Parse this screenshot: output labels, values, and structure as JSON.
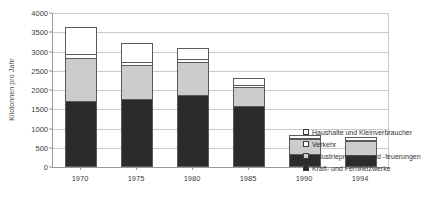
{
  "chart_data": {
    "type": "bar",
    "stacked": true,
    "title": "",
    "subtitle": "",
    "xlabel": "",
    "ylabel": "Kilotonnen pro Jahr",
    "categories": [
      "1970",
      "1975",
      "1980",
      "1985",
      "1990",
      "1994"
    ],
    "ylim": [
      0,
      4000
    ],
    "ytick_step": 500,
    "yticks": [
      "0",
      "500",
      "1000",
      "1500",
      "2000",
      "2500",
      "3000",
      "3500",
      "4000"
    ],
    "ytick_values": [
      0,
      500,
      1000,
      1500,
      2000,
      2500,
      3000,
      3500,
      4000
    ],
    "grid": true,
    "grid_axis": "y",
    "legend_position": "right-lower",
    "stack_order_bottom_to_top": [
      "Kraft- und Fernheizwerke",
      "Industrieprozesse und -feuerungen",
      "Verkehr",
      "Haushalte und Kleinverbraucher"
    ],
    "series": [
      {
        "name": "Haushalte und Kleinverbraucher",
        "color": "#ffffff",
        "values": [
          720,
          510,
          300,
          210,
          100,
          110
        ]
      },
      {
        "name": "Verkehr",
        "color": "#ffffff",
        "values": [
          130,
          120,
          110,
          70,
          50,
          50
        ]
      },
      {
        "name": "Industrieprozesse und -feuerungen",
        "color": "#cccccc",
        "values": [
          1150,
          900,
          870,
          520,
          420,
          390
        ]
      },
      {
        "name": "Kraft- und Fernheizwerke",
        "color": "#2b2b2b",
        "values": [
          1710,
          1770,
          1880,
          1580,
          330,
          310
        ]
      }
    ],
    "totals": [
      3710,
      3300,
      3160,
      2380,
      900,
      860
    ]
  },
  "legend": {
    "items": [
      {
        "label": "Haushalte und Kleinverbraucher",
        "color": "#ffffff"
      },
      {
        "label": "Verkehr",
        "color": "#ffffff"
      },
      {
        "label": "Industrieprozesse und -feuerungen",
        "color": "#cccccc"
      },
      {
        "label": "Kraft- und Fernheizwerke",
        "color": "#2b2b2b"
      }
    ]
  },
  "axes": {
    "y_title": "Kilotonnen pro Jahr"
  },
  "colors": {
    "axis": "#9a9a9a",
    "grid": "#c9c9c9",
    "bar_outline": "#5a5a5a",
    "text": "#3d3d3d",
    "background": "#ffffff"
  }
}
